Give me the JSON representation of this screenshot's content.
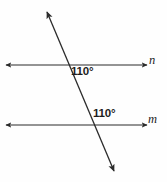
{
  "figure": {
    "background_color": "#fefefe",
    "stroke_color": "#2b2b2b",
    "text_color": "#1d1d1d",
    "width": 167,
    "height": 182,
    "lines": {
      "line_n": {
        "label": "n",
        "y": 65,
        "x_start": 6,
        "x_end": 147,
        "arrow_start": true,
        "arrow_end": true
      },
      "line_m": {
        "label": "m",
        "y": 125,
        "x_start": 6,
        "x_end": 147,
        "arrow_start": true,
        "arrow_end": true
      },
      "transversal": {
        "label": "",
        "x_start": 47,
        "y_start": 12,
        "x_end": 114,
        "y_end": 171,
        "arrow_start": true,
        "arrow_end": true
      }
    },
    "intersections": [
      {
        "name": "upper",
        "x": 68,
        "y": 65
      },
      {
        "name": "lower",
        "x": 92,
        "y": 125
      }
    ],
    "angles": [
      {
        "name": "angle-upper",
        "value": "110°",
        "x": 71,
        "y": 66
      },
      {
        "name": "angle-lower",
        "value": "110°",
        "x": 93,
        "y": 108
      }
    ]
  }
}
